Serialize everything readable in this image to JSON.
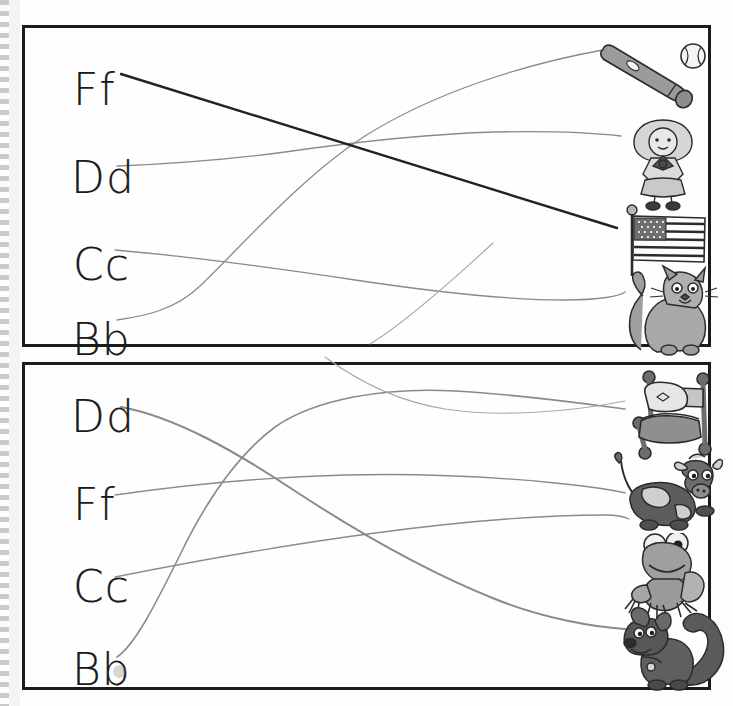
{
  "worksheet": {
    "title": "Letter and Picture Matching Worksheet",
    "ink_color_dark": "#1a1a1a",
    "ink_color_pencil": "#7d7d7d",
    "border_color": "#1c1c1c"
  },
  "panels": [
    {
      "id": "panel-top",
      "name": "top-panel",
      "letters": [
        {
          "label": "Ff",
          "x": 48,
          "y": 40,
          "row": 0
        },
        {
          "label": "Dd",
          "x": 46,
          "y": 128,
          "row": 1
        },
        {
          "label": "Cc",
          "x": 48,
          "y": 215,
          "row": 2
        },
        {
          "label": "Bb",
          "x": 47,
          "y": 290,
          "row": 3
        }
      ],
      "pictures": [
        {
          "name": "baseball-bat-and-ball",
          "alt": "baseball bat and ball",
          "x": 568,
          "y": 12,
          "w": 125,
          "h": 82
        },
        {
          "name": "doll",
          "alt": "rag doll",
          "x": 598,
          "y": 90,
          "w": 78,
          "h": 92
        },
        {
          "name": "american-flag",
          "alt": "American flag",
          "x": 597,
          "y": 180,
          "w": 88,
          "h": 70
        },
        {
          "name": "cat",
          "alt": "grey cat",
          "x": 596,
          "y": 240,
          "w": 100,
          "h": 86
        }
      ],
      "connections": [
        {
          "from": "Ff",
          "to": "american-flag",
          "style": "dark"
        },
        {
          "from": "Dd",
          "to": "doll",
          "style": "pencil"
        },
        {
          "from": "Cc",
          "to": "cat",
          "style": "pencil"
        },
        {
          "from": "Bb",
          "to": "baseball-bat-and-ball",
          "style": "pencil"
        }
      ]
    },
    {
      "id": "panel-bottom",
      "name": "bottom-panel",
      "letters": [
        {
          "label": "Dd",
          "x": 46,
          "y": 30,
          "row": 0
        },
        {
          "label": "Ff",
          "x": 48,
          "y": 118,
          "row": 1
        },
        {
          "label": "Cc",
          "x": 48,
          "y": 200,
          "row": 2
        },
        {
          "label": "Bb",
          "x": 47,
          "y": 283,
          "row": 3
        }
      ],
      "pictures": [
        {
          "name": "bed",
          "alt": "bed with pillow",
          "x": 604,
          "y": 5,
          "w": 92,
          "h": 88
        },
        {
          "name": "cow",
          "alt": "spotted cow",
          "x": 590,
          "y": 88,
          "w": 105,
          "h": 88
        },
        {
          "name": "frog",
          "alt": "green frog",
          "x": 602,
          "y": 172,
          "w": 90,
          "h": 82
        },
        {
          "name": "squirrel",
          "alt": "dog with bushy tail",
          "x": 596,
          "y": 242,
          "w": 104,
          "h": 88
        }
      ],
      "connections": [
        {
          "from": "Dd",
          "to": "squirrel",
          "style": "pencil"
        },
        {
          "from": "Ff",
          "to": "cow",
          "style": "pencil"
        },
        {
          "from": "Cc",
          "to": "frog",
          "style": "pencil"
        },
        {
          "from": "Bb",
          "to": "bed",
          "style": "pencil"
        }
      ]
    }
  ]
}
